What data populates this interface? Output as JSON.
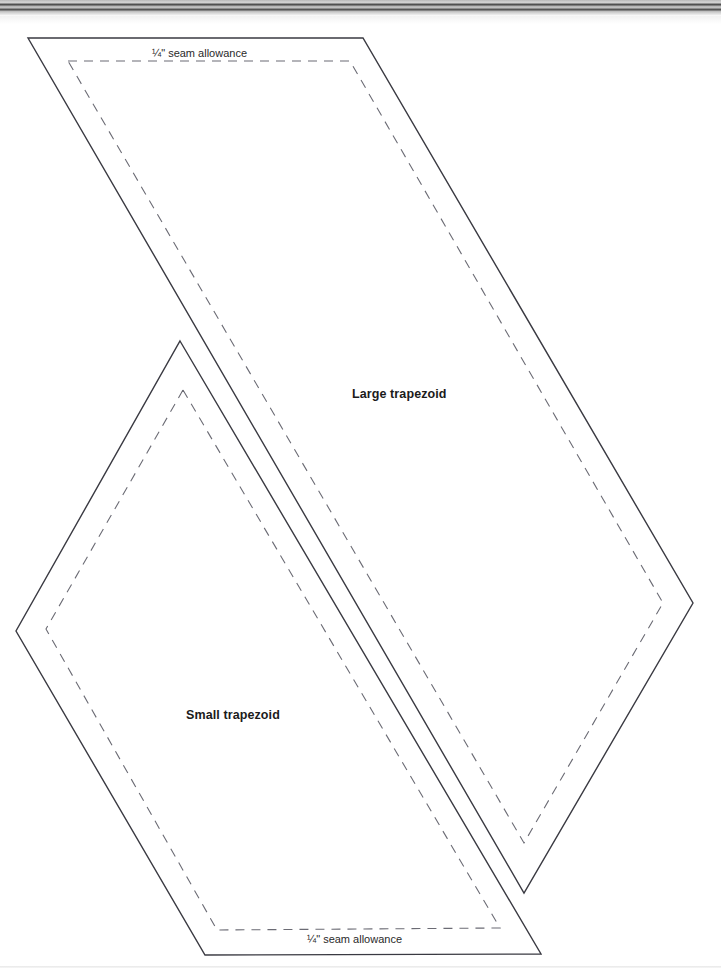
{
  "page": {
    "background_color": "#ffffff",
    "width": 721,
    "height": 973
  },
  "scan": {
    "top_band_name": "scanned-page-gutter-shadow",
    "bottom_rule_name": "scanned-page-bottom-edge"
  },
  "labels": {
    "large_shape": "Large trapezoid",
    "small_shape": "Small trapezoid",
    "seam_allowance_top": "¼\" seam allowance",
    "seam_allowance_bottom": "¼\" seam allowance"
  },
  "colors": {
    "cut_line": "#3a3a42",
    "seam_line": "#6b6b74",
    "text": "#1b1b1b",
    "paper": "#ffffff"
  },
  "shapes": [
    {
      "name": "large-trapezoid",
      "label": "Large trapezoid",
      "cut_line_points": "28,38 363,38 693,603 524,893",
      "seam_line_points": "68,61 350,61 663,603 524,843",
      "seam_allowance": "¼\"",
      "line_style_outer": "solid",
      "line_style_inner": "dashed"
    },
    {
      "name": "small-trapezoid",
      "label": "Small trapezoid",
      "cut_line_points": "180,341 541,954 205,955 16,631",
      "seam_line_points": "183,390 500,928 217,930 46,629",
      "seam_allowance": "¼\"",
      "line_style_outer": "solid",
      "line_style_inner": "dashed"
    }
  ]
}
